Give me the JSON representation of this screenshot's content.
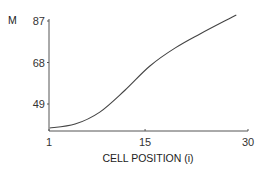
{
  "chart_data": {
    "type": "line",
    "title": "",
    "xlabel": "CELL POSITION (i)",
    "ylabel": "M",
    "xlim": [
      1,
      30
    ],
    "ylim": [
      36.5,
      87
    ],
    "x_ticks": [
      1,
      15,
      30
    ],
    "y_ticks": [
      49,
      68,
      87
    ],
    "x_tick_labels": [
      "1",
      "15",
      "30"
    ],
    "y_tick_labels": [
      "49",
      "68",
      "87"
    ],
    "grid": false,
    "legend": "none",
    "series": [
      {
        "name": "M",
        "x": [
          1.1,
          4.8,
          8.4,
          12.1,
          15.7,
          19.4,
          23.0,
          28.3
        ],
        "y": [
          38.0,
          39.8,
          45.3,
          55.4,
          66.4,
          74.7,
          81.1,
          89.8
        ]
      }
    ]
  }
}
